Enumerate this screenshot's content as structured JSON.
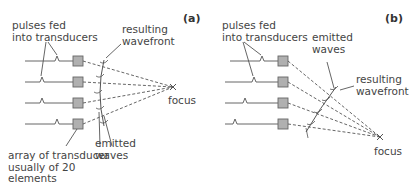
{
  "panels": [
    {
      "id": "a",
      "tag": "(a)",
      "labels": {
        "pulses": "pulses fed\ninto transducers",
        "wavefront": "resulting\nwavefront",
        "focus": "focus",
        "emitted": "emitted\nwaves",
        "array": "array of transducer\nusually of 20\nelements"
      },
      "element_count_shown": 4,
      "focus_mode": "on-axis focus (symmetric delays)"
    },
    {
      "id": "b",
      "tag": "(b)",
      "labels": {
        "pulses": "pulses fed\ninto transducers",
        "emitted": "emitted\nwaves",
        "wavefront": "resulting\nwavefront",
        "focus": "focus"
      },
      "element_count_shown": 4,
      "focus_mode": "steered focus (progressive delays)"
    }
  ],
  "colors": {
    "line": "#555555",
    "transducer_fill": "#b0b0b0",
    "transducer_stroke": "#666666",
    "text": "#444444"
  }
}
